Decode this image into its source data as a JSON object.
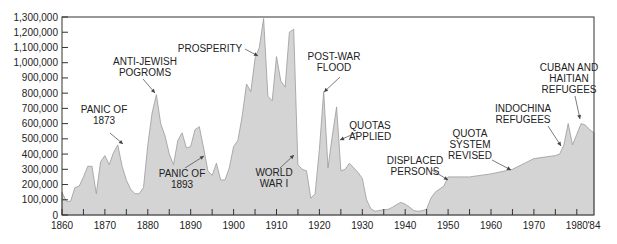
{
  "chart_data": {
    "type": "area",
    "title": "",
    "xlabel": "",
    "ylabel": "",
    "xlim": [
      1860,
      1984
    ],
    "ylim": [
      0,
      1300000
    ],
    "grid": false,
    "legend": null,
    "fill_color": "#d4d4d4",
    "line_color": "#9a9a9a",
    "y_ticks": [
      0,
      100000,
      200000,
      300000,
      400000,
      500000,
      600000,
      700000,
      800000,
      900000,
      1000000,
      1100000,
      1200000,
      1300000
    ],
    "y_tick_labels": [
      "0",
      "100,000",
      "200,000",
      "300,000",
      "400,000",
      "500,000",
      "600,000",
      "700,000",
      "800,000",
      "900,000",
      "1,000,000",
      "1,100,000",
      "1,200,000",
      "1,300,000"
    ],
    "x_ticks": [
      1860,
      1865,
      1870,
      1875,
      1880,
      1885,
      1890,
      1895,
      1900,
      1905,
      1910,
      1915,
      1920,
      1925,
      1930,
      1935,
      1940,
      1945,
      1950,
      1955,
      1960,
      1965,
      1970,
      1975,
      1980
    ],
    "x_tick_labels": [
      {
        "year": 1860,
        "label": "1860"
      },
      {
        "year": 1870,
        "label": "1870"
      },
      {
        "year": 1880,
        "label": "1880"
      },
      {
        "year": 1890,
        "label": "1890"
      },
      {
        "year": 1900,
        "label": "1900"
      },
      {
        "year": 1910,
        "label": "1910"
      },
      {
        "year": 1920,
        "label": "1920"
      },
      {
        "year": 1930,
        "label": "1930"
      },
      {
        "year": 1940,
        "label": "1940"
      },
      {
        "year": 1950,
        "label": "1950"
      },
      {
        "year": 1960,
        "label": "1960"
      },
      {
        "year": 1970,
        "label": "1970"
      },
      {
        "year": 1980,
        "label": "1980"
      },
      {
        "year": 1984,
        "label": "'84"
      }
    ],
    "series": [
      {
        "name": "Immigrants to the United States",
        "x": [
          1860,
          1861,
          1862,
          1863,
          1864,
          1865,
          1866,
          1867,
          1868,
          1869,
          1870,
          1871,
          1872,
          1873,
          1874,
          1875,
          1876,
          1877,
          1878,
          1879,
          1880,
          1881,
          1882,
          1883,
          1884,
          1885,
          1886,
          1887,
          1888,
          1889,
          1890,
          1891,
          1892,
          1893,
          1894,
          1895,
          1896,
          1897,
          1898,
          1899,
          1900,
          1901,
          1902,
          1903,
          1904,
          1905,
          1906,
          1907,
          1908,
          1909,
          1910,
          1911,
          1912,
          1913,
          1914,
          1915,
          1916,
          1917,
          1918,
          1919,
          1920,
          1921,
          1922,
          1923,
          1924,
          1925,
          1926,
          1927,
          1928,
          1929,
          1930,
          1931,
          1932,
          1933,
          1934,
          1935,
          1936,
          1937,
          1938,
          1939,
          1940,
          1941,
          1942,
          1943,
          1944,
          1945,
          1946,
          1947,
          1948,
          1949,
          1950,
          1955,
          1960,
          1965,
          1970,
          1975,
          1976,
          1977,
          1978,
          1979,
          1980,
          1981,
          1982,
          1983,
          1984
        ],
        "values": [
          150000,
          90000,
          90000,
          180000,
          190000,
          250000,
          320000,
          320000,
          140000,
          350000,
          390000,
          330000,
          410000,
          460000,
          320000,
          230000,
          170000,
          140000,
          140000,
          180000,
          460000,
          670000,
          790000,
          600000,
          520000,
          400000,
          330000,
          490000,
          540000,
          440000,
          450000,
          560000,
          580000,
          440000,
          290000,
          260000,
          340000,
          230000,
          230000,
          310000,
          450000,
          490000,
          650000,
          860000,
          810000,
          1030000,
          1100000,
          1290000,
          780000,
          750000,
          1040000,
          880000,
          840000,
          1200000,
          1220000,
          330000,
          300000,
          290000,
          110000,
          140000,
          430000,
          810000,
          310000,
          520000,
          710000,
          290000,
          300000,
          340000,
          310000,
          280000,
          240000,
          100000,
          40000,
          25000,
          30000,
          35000,
          37000,
          50000,
          68000,
          83000,
          71000,
          52000,
          29000,
          24000,
          29000,
          38000,
          110000,
          150000,
          170000,
          190000,
          250000,
          250000,
          270000,
          300000,
          370000,
          390000,
          400000,
          460000,
          600000,
          460000,
          530000,
          600000,
          590000,
          560000,
          540000
        ]
      }
    ],
    "annotations": [
      {
        "text": [
          "PANIC OF",
          "1873"
        ],
        "year": 1873
      },
      {
        "text": [
          "ANTI-JEWISH",
          "POGROMS"
        ],
        "year": 1882
      },
      {
        "text": [
          "PANIC OF",
          "1893"
        ],
        "year": 1893
      },
      {
        "text": [
          "PROSPERITY"
        ],
        "year": 1905
      },
      {
        "text": [
          "WORLD",
          "WAR I"
        ],
        "year": 1914
      },
      {
        "text": [
          "POST-WAR",
          "FLOOD"
        ],
        "year": 1921
      },
      {
        "text": [
          "QUOTAS",
          "APPLIED"
        ],
        "year": 1924
      },
      {
        "text": [
          "DISPLACED",
          "PERSONS"
        ],
        "year": 1948
      },
      {
        "text": [
          "QUOTA",
          "SYSTEM",
          "REVISED"
        ],
        "year": 1965
      },
      {
        "text": [
          "INDOCHINA",
          "REFUGEES"
        ],
        "year": 1978
      },
      {
        "text": [
          "CUBAN AND",
          "HAITIAN",
          "REFUGEES"
        ],
        "year": 1980
      }
    ]
  }
}
